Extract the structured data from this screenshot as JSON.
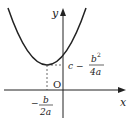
{
  "diagram": {
    "type": "parabola-graph",
    "axes": {
      "x_label": "x",
      "y_label": "y",
      "origin_label": "O"
    },
    "vertex": {
      "x_label": {
        "numerator": "b",
        "denominator": "2a",
        "sign": "−"
      },
      "y_label": {
        "prefix": "c −",
        "numerator": "b",
        "exponent": "2",
        "denominator": "4a"
      }
    }
  }
}
